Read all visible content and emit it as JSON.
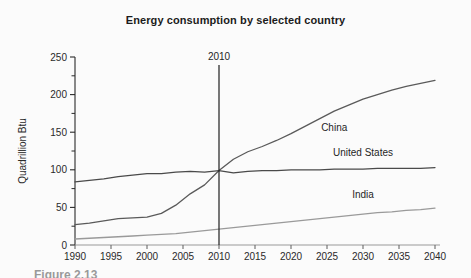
{
  "figure": {
    "title": "Energy consumption by selected country",
    "caption_partial": "Figure 2.13"
  },
  "chart_data": {
    "type": "line",
    "title": "Energy consumption by selected country",
    "xlabel": "",
    "ylabel": "Quadrillion Btu",
    "xlim": [
      1990,
      2040
    ],
    "ylim": [
      0,
      250
    ],
    "xticks": [
      1990,
      1995,
      2000,
      2005,
      2010,
      2015,
      2020,
      2025,
      2030,
      2035,
      2040
    ],
    "yticks": [
      0,
      50,
      100,
      150,
      200,
      250
    ],
    "yminorticks": [
      25,
      75,
      125,
      175,
      225
    ],
    "grid": false,
    "legend_position": "inline-labels",
    "annotations": [
      {
        "text": "2010",
        "type": "vertical-marker-line",
        "x": 2010
      }
    ],
    "x": [
      1990,
      1992,
      1994,
      1996,
      1998,
      2000,
      2002,
      2004,
      2006,
      2008,
      2010,
      2012,
      2014,
      2016,
      2018,
      2020,
      2022,
      2024,
      2026,
      2028,
      2030,
      2032,
      2034,
      2036,
      2038,
      2040
    ],
    "series": [
      {
        "name": "China",
        "label": "China",
        "color": "#5a5a5a",
        "values": [
          27,
          29,
          32,
          35,
          36,
          37,
          42,
          53,
          68,
          80,
          99,
          114,
          124,
          131,
          139,
          148,
          158,
          168,
          178,
          186,
          194,
          200,
          206,
          211,
          215,
          219
        ]
      },
      {
        "name": "United States",
        "label": "United States",
        "color": "#4a4a4a",
        "values": [
          84,
          86,
          88,
          91,
          93,
          95,
          95,
          97,
          98,
          97,
          99,
          96,
          98,
          99,
          99,
          100,
          100,
          100,
          101,
          101,
          101,
          102,
          102,
          102,
          102,
          103
        ]
      },
      {
        "name": "India",
        "label": "India",
        "color": "#9a9a9a",
        "values": [
          8,
          9,
          10,
          11,
          12,
          13,
          14,
          15,
          17,
          19,
          21,
          23,
          25,
          27,
          29,
          31,
          33,
          35,
          37,
          39,
          41,
          43,
          44,
          46,
          47,
          49
        ]
      }
    ],
    "series_label_positions": [
      {
        "name": "China",
        "x": 2026,
        "y": 152
      },
      {
        "name": "United States",
        "x": 2030,
        "y": 118
      },
      {
        "name": "India",
        "x": 2030,
        "y": 62
      }
    ]
  }
}
